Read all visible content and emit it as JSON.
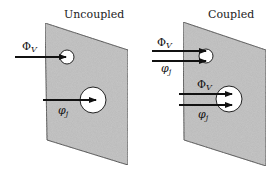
{
  "colors": {
    "panel_fill": "#b9b9b9",
    "panel_stroke": "#2a2a2a",
    "hole_fill": "#ffffff",
    "arrow": "#111111",
    "text": "#222222"
  },
  "panels": [
    {
      "id": "uncoupled",
      "title": "Uncoupled",
      "holes": [
        {
          "size": "small",
          "arrows": [
            {
              "symbol": "Φ",
              "subscript": "V"
            }
          ]
        },
        {
          "size": "large",
          "arrows": [
            {
              "symbol": "φ",
              "subscript": "j"
            }
          ]
        }
      ]
    },
    {
      "id": "coupled",
      "title": "Coupled",
      "holes": [
        {
          "size": "small",
          "arrows": [
            {
              "symbol": "Φ",
              "subscript": "V"
            },
            {
              "symbol": "φ",
              "subscript": "j"
            }
          ]
        },
        {
          "size": "large",
          "arrows": [
            {
              "symbol": "Φ",
              "subscript": "V"
            },
            {
              "symbol": "φ",
              "subscript": "j"
            }
          ]
        }
      ]
    }
  ]
}
